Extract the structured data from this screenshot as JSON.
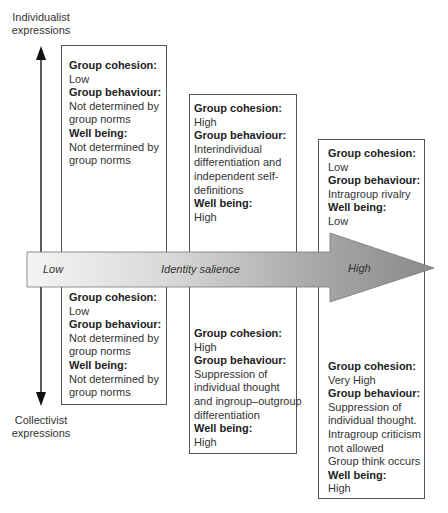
{
  "vertical_axis": {
    "top_label": "Individualist\nexpressions",
    "bottom_label": "Collectivist\nexpressions"
  },
  "salience_arrow": {
    "low_label": "Low",
    "title": "Identity salience",
    "high_label": "High"
  },
  "columns": [
    {
      "upper": {
        "cohesion_heading": "Group cohesion:",
        "cohesion_value": "Low",
        "behaviour_heading": "Group behaviour:",
        "behaviour_value": "Not determined by\ngroup norms",
        "wellbeing_heading": "Well being:",
        "wellbeing_value": "Not determined by\ngroup norms"
      },
      "lower": {
        "cohesion_heading": "Group cohesion:",
        "cohesion_value": "Low",
        "behaviour_heading": "Group behaviour:",
        "behaviour_value": "Not determined by\ngroup norms",
        "wellbeing_heading": "Well being:",
        "wellbeing_value": "Not determined by\ngroup norms"
      }
    },
    {
      "upper": {
        "cohesion_heading": "Group cohesion:",
        "cohesion_value": "High",
        "behaviour_heading": "Group behaviour:",
        "behaviour_value": "Interindividual\ndifferentiation and\nindependent self-\ndefinitions",
        "wellbeing_heading": "Well being:",
        "wellbeing_value": "High"
      },
      "lower": {
        "cohesion_heading": "Group cohesion:",
        "cohesion_value": "High",
        "behaviour_heading": "Group behaviour:",
        "behaviour_value": "Suppression of\nindividual thought\nand ingroup–outgroup\ndifferentiation",
        "wellbeing_heading": "Well being:",
        "wellbeing_value": "High"
      }
    },
    {
      "upper": {
        "cohesion_heading": "Group cohesion:",
        "cohesion_value": "Low",
        "behaviour_heading": "Group behaviour:",
        "behaviour_value": "Intragroup rivalry",
        "wellbeing_heading": "Well being:",
        "wellbeing_value": "Low"
      },
      "lower": {
        "cohesion_heading": "Group cohesion:",
        "cohesion_value": "Very High",
        "behaviour_heading": "Group behaviour:",
        "behaviour_value": "Suppression of\nindividual thought.\nIntragroup criticism\nnot allowed\nGroup think occurs",
        "wellbeing_heading": "Well being:",
        "wellbeing_value": "High"
      }
    }
  ]
}
